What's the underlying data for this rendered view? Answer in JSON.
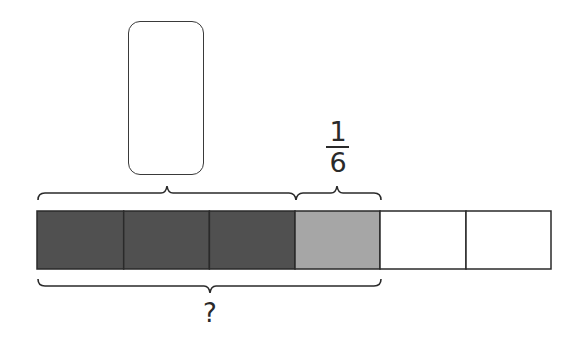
{
  "diagram": {
    "type": "tape-diagram",
    "total_parts": 6,
    "segments": [
      {
        "index": 0,
        "fill": "#505050",
        "shade": "dark"
      },
      {
        "index": 1,
        "fill": "#505050",
        "shade": "dark"
      },
      {
        "index": 2,
        "fill": "#505050",
        "shade": "dark"
      },
      {
        "index": 3,
        "fill": "#a6a6a6",
        "shade": "light"
      },
      {
        "index": 4,
        "fill": "#ffffff",
        "shade": "empty"
      },
      {
        "index": 5,
        "fill": "#ffffff",
        "shade": "empty"
      }
    ],
    "top_brace_left": {
      "spans_segments": [
        0,
        2
      ],
      "label": "answer-box"
    },
    "top_brace_right": {
      "spans_segments": [
        3,
        3
      ],
      "label": {
        "numerator": "1",
        "denominator": "6"
      }
    },
    "bottom_brace": {
      "spans_segments": [
        0,
        3
      ],
      "label": "?"
    },
    "answer_box": {
      "value": ""
    },
    "colors": {
      "stroke": "#2a2a2a",
      "dark": "#505050",
      "light": "#a6a6a6",
      "empty": "#ffffff"
    }
  }
}
